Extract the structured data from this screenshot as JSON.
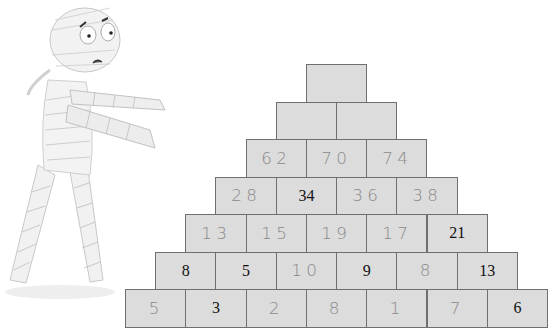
{
  "illustration": {
    "name": "scared-mummy",
    "description": "Cartoon mummy with bulging eyes walking with arms outstretched"
  },
  "pyramid": {
    "block_width": 60.3,
    "block_height": 37.5,
    "origin_x": 125,
    "bottom_y": 289,
    "fill": "#dcdcdc",
    "border": "#6f6f6f",
    "rows": [
      {
        "row": 1,
        "cells": [
          {
            "value": "",
            "style": "empty"
          }
        ]
      },
      {
        "row": 2,
        "cells": [
          {
            "value": "",
            "style": "empty"
          },
          {
            "value": "",
            "style": "empty"
          }
        ]
      },
      {
        "row": 3,
        "cells": [
          {
            "value": "62",
            "style": "hand"
          },
          {
            "value": "70",
            "style": "hand"
          },
          {
            "value": "74",
            "style": "hand"
          }
        ]
      },
      {
        "row": 4,
        "cells": [
          {
            "value": "28",
            "style": "hand"
          },
          {
            "value": "34",
            "style": "printed"
          },
          {
            "value": "36",
            "style": "hand"
          },
          {
            "value": "38",
            "style": "hand"
          }
        ]
      },
      {
        "row": 5,
        "cells": [
          {
            "value": "13",
            "style": "hand"
          },
          {
            "value": "15",
            "style": "hand"
          },
          {
            "value": "19",
            "style": "hand"
          },
          {
            "value": "17",
            "style": "hand"
          },
          {
            "value": "21",
            "style": "printed"
          }
        ]
      },
      {
        "row": 6,
        "cells": [
          {
            "value": "8",
            "style": "printed"
          },
          {
            "value": "5",
            "style": "printed"
          },
          {
            "value": "10",
            "style": "hand"
          },
          {
            "value": "9",
            "style": "printed"
          },
          {
            "value": "8",
            "style": "hand"
          },
          {
            "value": "13",
            "style": "printed"
          }
        ]
      },
      {
        "row": 7,
        "cells": [
          {
            "value": "5",
            "style": "hand"
          },
          {
            "value": "3",
            "style": "printed"
          },
          {
            "value": "2",
            "style": "hand"
          },
          {
            "value": "8",
            "style": "hand"
          },
          {
            "value": "1",
            "style": "hand"
          },
          {
            "value": "7",
            "style": "hand"
          },
          {
            "value": "6",
            "style": "printed"
          }
        ]
      }
    ]
  }
}
